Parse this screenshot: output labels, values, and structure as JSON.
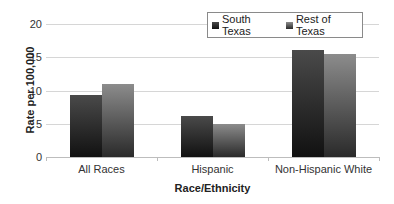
{
  "chart_data": {
    "type": "bar",
    "title": "",
    "xlabel": "Race/Ethnicity",
    "ylabel": "Rate per 100,000",
    "ylim": [
      0,
      20
    ],
    "yticks": [
      0,
      5,
      10,
      15,
      20
    ],
    "grid": true,
    "legend_position": "top-right",
    "categories": [
      "All Races",
      "Hispanic",
      "Non-Hispanic White"
    ],
    "series": [
      {
        "name": "South Texas",
        "values": [
          9.3,
          6.1,
          16.1
        ],
        "color": "#2a2a2a"
      },
      {
        "name": "Rest of Texas",
        "values": [
          11.0,
          4.9,
          15.5
        ],
        "color": "#6e6e6e"
      }
    ]
  }
}
